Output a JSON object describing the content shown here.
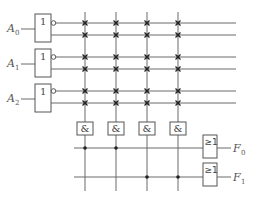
{
  "diagram": {
    "title": "",
    "inputs": [
      {
        "name": "A",
        "sub": "0",
        "gate_label": "1"
      },
      {
        "name": "A",
        "sub": "1",
        "gate_label": "1"
      },
      {
        "name": "A",
        "sub": "2",
        "gate_label": "1"
      }
    ],
    "and_gates": [
      {
        "label": "&"
      },
      {
        "label": "&"
      },
      {
        "label": "&"
      },
      {
        "label": "&"
      }
    ],
    "or_gates": [
      {
        "label": "≥1",
        "output": "F",
        "sub": "0",
        "connected_and_columns": [
          0,
          1
        ]
      },
      {
        "label": "≥1",
        "output": "F",
        "sub": "1",
        "connected_and_columns": [
          2,
          3
        ]
      }
    ],
    "and_array_marker": "programmable-connection-x",
    "or_array_marker": "fixed-connection-dot",
    "colors": {
      "line": "#6b6b6b",
      "marker": "#222222",
      "background": "#ffffff"
    }
  }
}
